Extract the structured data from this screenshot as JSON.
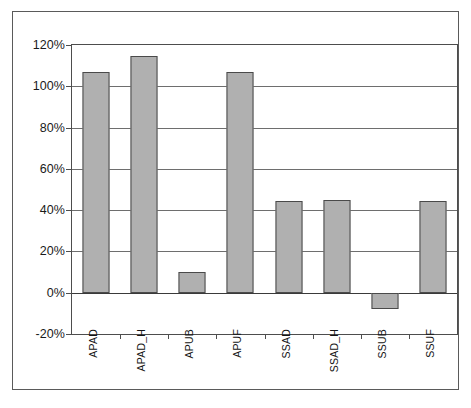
{
  "chart_data": {
    "type": "bar",
    "title": "",
    "subtitle": "",
    "xlabel": "",
    "ylabel": "",
    "categories": [
      "APAD",
      "APAD_H",
      "APUB",
      "APUF",
      "SSAD",
      "SSAD_H",
      "SSUB",
      "SSUF"
    ],
    "values": [
      107,
      114.5,
      10,
      107,
      44.5,
      45,
      -8,
      44.5
    ],
    "value_suffix": "%",
    "ylim": [
      -20,
      120
    ],
    "ytick_labels": [
      "120%",
      "100%",
      "80%",
      "60%",
      "40%",
      "20%",
      "0%",
      "-20%"
    ],
    "ytick_values": [
      120,
      100,
      80,
      60,
      40,
      20,
      0,
      -20
    ],
    "grid": true,
    "grid_axis": "y",
    "legend": false,
    "legend_position": "none",
    "series": [
      {
        "name": "",
        "values": [
          107,
          114.5,
          10,
          107,
          44.5,
          45,
          -8,
          44.5
        ]
      }
    ],
    "colors": {
      "bar_fill": "#b0b0b0",
      "bar_border": "#4a4a4a",
      "gridline": "#6e6e6e",
      "axis": "#4d4d4d",
      "frame": "#5a5a5a",
      "text": "#141414",
      "background": "#ffffff"
    }
  }
}
